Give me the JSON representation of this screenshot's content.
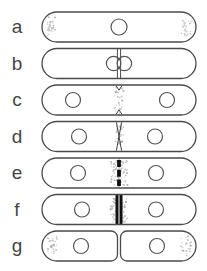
{
  "figure": {
    "canvas": {
      "width": 207,
      "height": 271,
      "background": "#ffffff"
    },
    "style": {
      "outline_color": "#4a4a4a",
      "nucleus_color": "#555555",
      "mark_color": "#2f2f2f",
      "septum_color": "#101010",
      "stipple_color": "#c7c7c7",
      "stipple_dark": "#aeaeae",
      "label_color": "#454545"
    },
    "capsule": {
      "x": 42,
      "width": 154,
      "height": 30,
      "split_gap": 3,
      "inner_radius": 6.5
    },
    "rows": [
      {
        "label": "a",
        "cy": 27,
        "center": "none",
        "stipple": "poles",
        "nuclei": [
          119
        ],
        "nucleus_r": 8
      },
      {
        "label": "b",
        "cy": 63.5,
        "center": "double-line",
        "stipple": "none",
        "nuclei": [],
        "nucleus_r": 7.2,
        "dumbbell": {
          "cx": 119,
          "offset": 5.4,
          "r": 7.2
        }
      },
      {
        "label": "c",
        "cy": 100,
        "center": "neck-marks",
        "stipple": "center-narrow",
        "nuclei": [
          73,
          167
        ],
        "nucleus_r": 7.5
      },
      {
        "label": "d",
        "cy": 136.5,
        "center": "cross",
        "stipple": "center-narrow",
        "nuclei": [
          79,
          155
        ],
        "nucleus_r": 7.5
      },
      {
        "label": "e",
        "cy": 173,
        "center": "dashed-septum",
        "stipple": "center-wide",
        "nuclei": [
          78,
          156
        ],
        "nucleus_r": 7.5
      },
      {
        "label": "f",
        "cy": 209.5,
        "center": "solid-septum",
        "stipple": "center-wide",
        "nuclei": [
          82,
          156
        ],
        "nucleus_r": 7.5
      },
      {
        "label": "g",
        "cy": 246,
        "center": "split",
        "stipple": "outer-poles",
        "nuclei": [
          81,
          157
        ],
        "nucleus_r": 7.5
      }
    ]
  }
}
